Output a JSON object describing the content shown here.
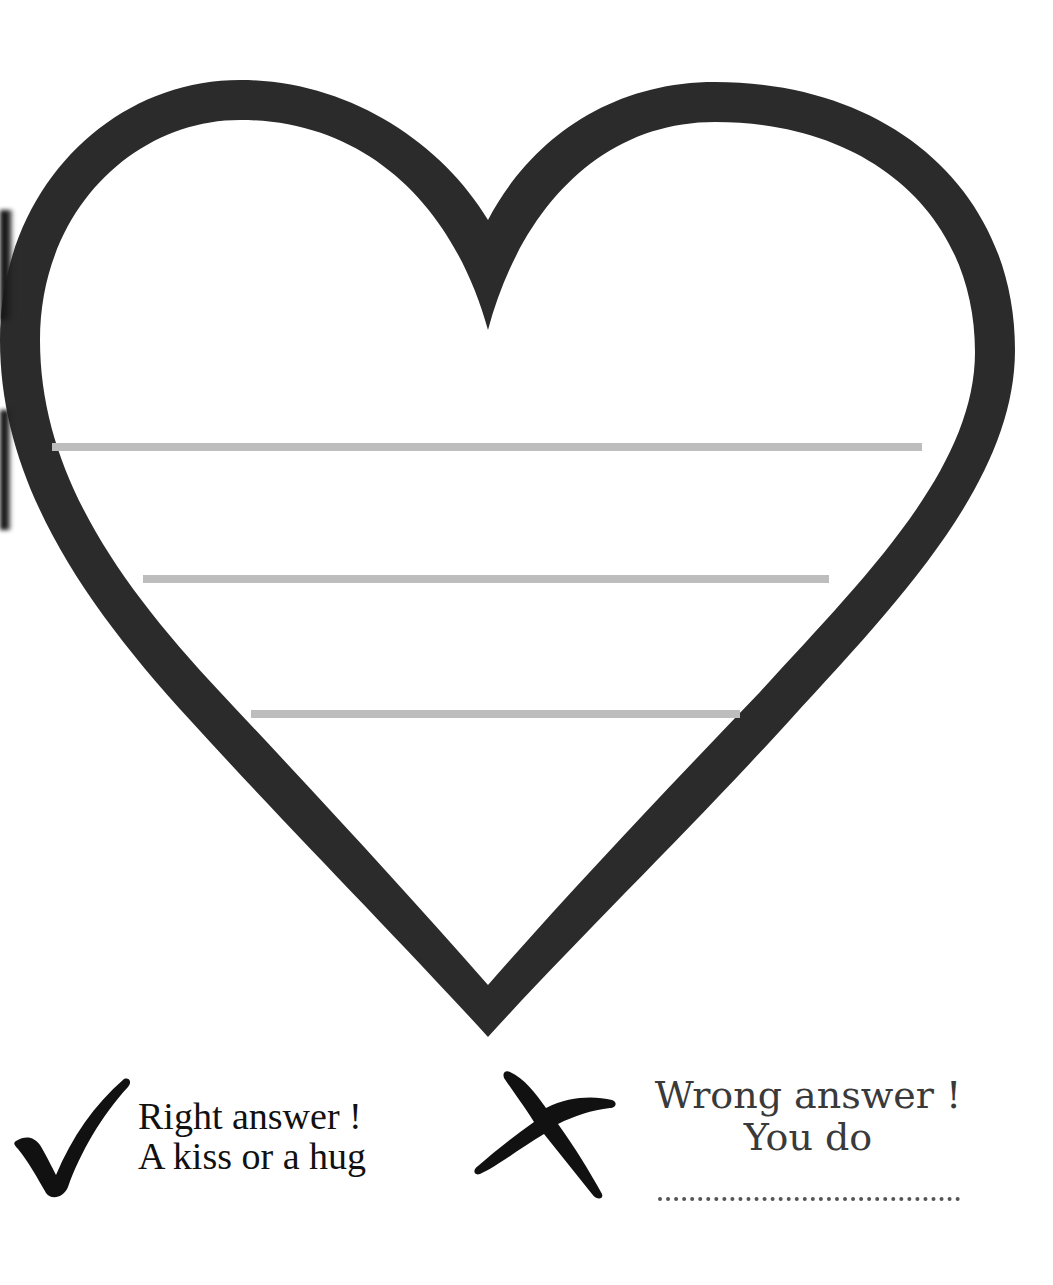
{
  "worksheet": {
    "heart": {
      "stroke_color": "#2b2b2b",
      "writing_lines": [
        {
          "x1": 52,
          "x2": 922,
          "y": 447
        },
        {
          "x1": 143,
          "x2": 829,
          "y": 579
        },
        {
          "x1": 251,
          "x2": 740,
          "y": 714
        }
      ],
      "line_color": "#bdbdbd"
    },
    "legend": {
      "right": {
        "icon": "checkmark-icon",
        "line1": "Right answer !",
        "line2": "A kiss or a hug"
      },
      "wrong": {
        "icon": "cross-icon",
        "line1": "Wrong answer !",
        "line2": "You do",
        "blank": "........................................"
      }
    }
  }
}
